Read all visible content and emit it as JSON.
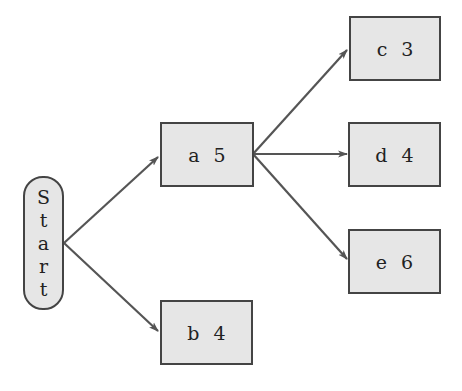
{
  "diagram": {
    "type": "tree",
    "start": {
      "label": "Start",
      "letters": [
        "S",
        "t",
        "a",
        "r",
        "t"
      ]
    },
    "nodes": [
      {
        "id": "a",
        "label": "a",
        "value": "5"
      },
      {
        "id": "b",
        "label": "b",
        "value": "4"
      },
      {
        "id": "c",
        "label": "c",
        "value": "3"
      },
      {
        "id": "d",
        "label": "d",
        "value": "4"
      },
      {
        "id": "e",
        "label": "e",
        "value": "6"
      }
    ],
    "edges": [
      {
        "from": "Start",
        "to": "a"
      },
      {
        "from": "Start",
        "to": "b"
      },
      {
        "from": "a",
        "to": "c"
      },
      {
        "from": "a",
        "to": "d"
      },
      {
        "from": "a",
        "to": "e"
      }
    ],
    "colors": {
      "node_fill": "#e6e6e6",
      "node_border": "#444444",
      "edge": "#555555",
      "text": "#222222"
    }
  }
}
